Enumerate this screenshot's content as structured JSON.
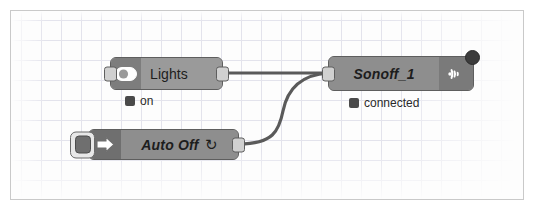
{
  "canvas": {
    "name": "node-red-flow-canvas",
    "grid_visible": true,
    "grid_spacing_px": 20,
    "background_color": "#fdfdfd",
    "border_color": "#c9c9c9",
    "wire_color": "#5a5a5a"
  },
  "nodes": [
    {
      "id": "lights",
      "label": "Lights",
      "label_style": "plain",
      "icon": "toggle-switch-icon",
      "node_color": "#9a9a9a",
      "icon_cell_color": "#7d7d7d",
      "has_input_port": true,
      "has_output_port": true,
      "status": {
        "text": "on",
        "dot_color": "#4a4a4a"
      }
    },
    {
      "id": "sonoff-1",
      "label": "Sonoff_1",
      "label_style": "italic",
      "icon": "wifi-signal-icon",
      "node_color": "#8e8e8e",
      "icon_cell_color": "#7a7a7a",
      "has_input_port": true,
      "has_output_port": false,
      "badge": "status-badge-circle",
      "status": {
        "text": "connected",
        "dot_color": "#4a4a4a"
      }
    },
    {
      "id": "auto-off",
      "label": "Auto Off",
      "label_suffix": "↻",
      "label_style": "italic",
      "icon": "arrow-right-inject-icon",
      "node_color": "#8e8e8e",
      "icon_cell_color": "#6f6f6f",
      "button": "inject-trigger-button",
      "has_input_port": false,
      "has_output_port": true,
      "status": null
    }
  ],
  "wires": [
    {
      "id": "wire-lights-to-sonoff",
      "from": "lights",
      "to": "sonoff-1",
      "shape": "straight"
    },
    {
      "id": "wire-autooff-to-sonoff",
      "from": "auto-off",
      "to": "sonoff-1",
      "shape": "curved"
    }
  ]
}
